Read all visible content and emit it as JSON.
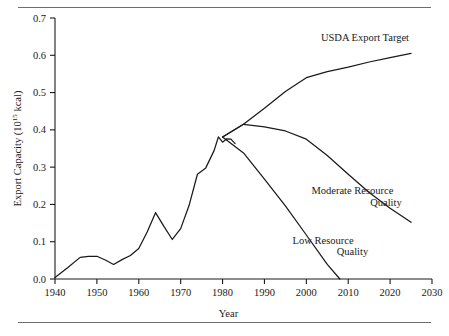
{
  "figure": {
    "background": "#ffffff",
    "line_color": "#1a1a1a",
    "rule_color": "#6d6d6d"
  },
  "chart_data": {
    "type": "line",
    "title": "",
    "xlabel": "Year",
    "ylabel": "Export Capacity (10¹⁵ kcal)",
    "ylabel_main": "Export Capacity (10",
    "ylabel_exponent": "15",
    "ylabel_tail": " kcal)",
    "xlim": [
      1940,
      2030
    ],
    "ylim": [
      0.0,
      0.7
    ],
    "grid": false,
    "legend_position": "inline-annotations",
    "xticks": [
      1940,
      1950,
      1960,
      1970,
      1980,
      1990,
      2000,
      2010,
      2020,
      2030
    ],
    "xticklabels": [
      "1940",
      "1950",
      "1960",
      "1970",
      "1980",
      "1990",
      "2000",
      "2010",
      "2020",
      "2030"
    ],
    "yticks": [
      0.0,
      0.1,
      0.2,
      0.3,
      0.4,
      0.5,
      0.6,
      0.7
    ],
    "yticklabels": [
      "0.0",
      "0.1",
      "0.2",
      "0.3",
      "0.4",
      "0.5",
      "0.6",
      "0.7"
    ],
    "series": [
      {
        "name": "Historical",
        "label": "",
        "x": [
          1940,
          1943,
          1946,
          1948,
          1950,
          1952,
          1954,
          1956,
          1958,
          1960,
          1962,
          1964,
          1966,
          1968,
          1970,
          1972,
          1974,
          1976,
          1978,
          1979,
          1980,
          1981,
          1982,
          1983
        ],
        "values": [
          0.004,
          0.03,
          0.058,
          0.061,
          0.061,
          0.051,
          0.039,
          0.052,
          0.063,
          0.082,
          0.126,
          0.178,
          0.141,
          0.106,
          0.135,
          0.197,
          0.281,
          0.298,
          0.345,
          0.381,
          0.367,
          0.376,
          0.375,
          0.363
        ]
      },
      {
        "name": "USDA Export Target",
        "label": "USDA Export Target",
        "x": [
          1980,
          1985,
          1990,
          1995,
          2000,
          2005,
          2010,
          2015,
          2020,
          2025
        ],
        "values": [
          0.381,
          0.415,
          0.458,
          0.503,
          0.54,
          0.556,
          0.568,
          0.582,
          0.594,
          0.605
        ]
      },
      {
        "name": "Moderate Resource Quality",
        "label": "Moderate Resource Quality",
        "label_line1": "Moderate Resource",
        "label_line2": "Quality",
        "x": [
          1980,
          1985,
          1990,
          1995,
          2000,
          2005,
          2010,
          2015,
          2020,
          2025
        ],
        "values": [
          0.381,
          0.415,
          0.408,
          0.397,
          0.375,
          0.331,
          0.281,
          0.232,
          0.19,
          0.152
        ]
      },
      {
        "name": "Low Resource Quality",
        "label": "Low Resource Quality",
        "label_line1": "Low Resource",
        "label_line2": "Quality",
        "x": [
          1980,
          1985,
          1990,
          1995,
          2000,
          2005,
          2008
        ],
        "values": [
          0.381,
          0.338,
          0.268,
          0.196,
          0.118,
          0.039,
          0.0
        ]
      }
    ],
    "annotations": [
      {
        "name": "usda-export-target-label",
        "text": "USDA Export Target",
        "x": 2014,
        "y": 0.638
      },
      {
        "name": "moderate-resource-quality-label-line1",
        "text": "Moderate Resource",
        "x": 2011,
        "y": 0.227
      },
      {
        "name": "moderate-resource-quality-label-line2",
        "text": "Quality",
        "x": 2019,
        "y": 0.197
      },
      {
        "name": "low-resource-quality-label-line1",
        "text": "Low Resource",
        "x": 2004,
        "y": 0.095
      },
      {
        "name": "low-resource-quality-label-line2",
        "text": "Quality",
        "x": 2011,
        "y": 0.065
      }
    ]
  }
}
